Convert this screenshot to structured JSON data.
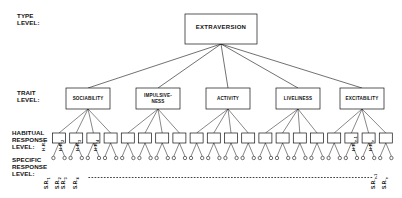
{
  "figure": {
    "type": "hierarchy-diagram"
  },
  "level_labels": {
    "type_level": "TYPE\nLEVEL:",
    "trait_level": "TRAIT\nLEVEL:",
    "habitual_response_level": "HABITUAL\nRESPONSE\nLEVEL:",
    "specific_response_level": "SPECIFIC\nRESPONSE\nLEVEL:"
  },
  "type_node": {
    "label": "EXTRAVERSION"
  },
  "trait_nodes": [
    {
      "label": "SOCIABILITY"
    },
    {
      "label": "IMPULSIVE-\nNESS"
    },
    {
      "label": "ACTIVITY"
    },
    {
      "label": "LIVELINESS"
    },
    {
      "label": "EXCITABILITY"
    }
  ],
  "habitual_response_nodes": {
    "count_per_trait": 4,
    "total": 20,
    "labelled": [
      {
        "base": "H.R.",
        "sub": "1",
        "index": 0
      },
      {
        "base": "H.R.",
        "sub": "2",
        "index": 1
      },
      {
        "base": "H.R.",
        "sub": "3",
        "index": 2
      },
      {
        "base": "H.R.",
        "sub": "4",
        "index": 3
      },
      {
        "base": "H.R.",
        "sub": "n-1",
        "index": 18
      },
      {
        "base": "H.R.",
        "sub": "n",
        "index": 19
      }
    ]
  },
  "specific_response_nodes": {
    "count_per_habitual": 2,
    "total": 40,
    "labelled": [
      {
        "base": "S.R.",
        "sub": "1",
        "index": 0
      },
      {
        "base": "S.R.",
        "sub": "2",
        "index": 1
      },
      {
        "base": "S.R.",
        "sub": "3",
        "index": 2
      },
      {
        "base": "S.R.",
        "sub": "4",
        "index": 3
      },
      {
        "base": "S.R.",
        "sub": "n-1",
        "index": 38
      },
      {
        "base": "S.R.",
        "sub": "n",
        "index": 39
      }
    ],
    "ellipsis": "· · · · · · · · · · · · · · · · · · · · · · · · · · · · · · · · · · · · · · · · ·"
  },
  "colors": {
    "stroke": "#111111",
    "background": "#ffffff",
    "text": "#111111"
  }
}
